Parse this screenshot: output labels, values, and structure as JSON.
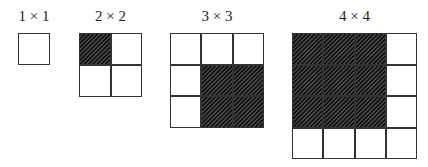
{
  "figure": {
    "grids": [
      {
        "label": "1 × 1",
        "size": 1,
        "shaded": []
      },
      {
        "label": "2 × 2",
        "size": 2,
        "shaded": [
          [
            0,
            0
          ]
        ]
      },
      {
        "label": "3 × 3",
        "size": 3,
        "shaded": [
          [
            1,
            1
          ],
          [
            1,
            2
          ],
          [
            2,
            1
          ],
          [
            2,
            2
          ]
        ]
      },
      {
        "label": "4 × 4",
        "size": 4,
        "shaded": [
          [
            0,
            0
          ],
          [
            0,
            1
          ],
          [
            0,
            2
          ],
          [
            1,
            0
          ],
          [
            1,
            1
          ],
          [
            1,
            2
          ],
          [
            2,
            0
          ],
          [
            2,
            1
          ],
          [
            2,
            2
          ]
        ]
      }
    ],
    "colors": {
      "line": "#333333",
      "shade": "#777777",
      "background": "#ffffff"
    }
  }
}
